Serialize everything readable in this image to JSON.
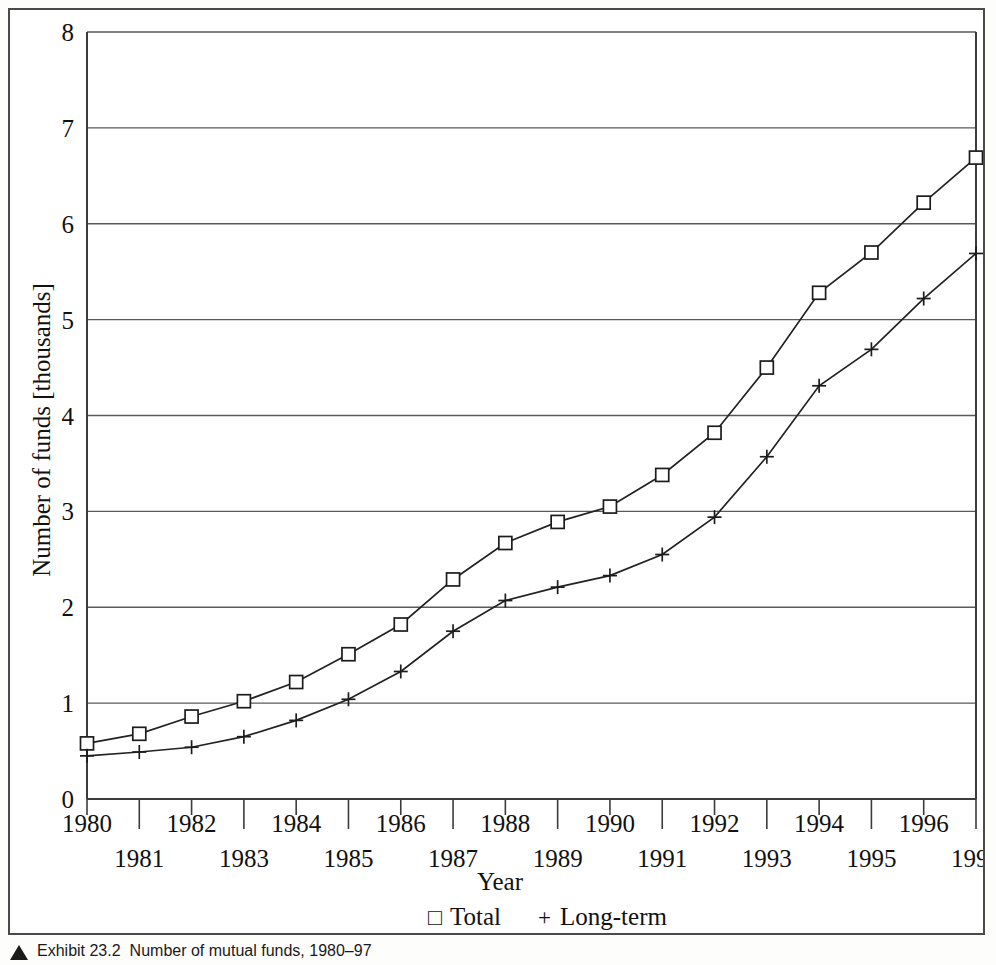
{
  "figure": {
    "caption_marker": "caption-triangle-icon",
    "caption_number": "Exhibit 23.2",
    "caption_text": "Number of mutual funds, 1980–97"
  },
  "chart_data": {
    "type": "line",
    "title": "",
    "xlabel": "Year",
    "ylabel": "Number of funds [thousands]",
    "xlim": [
      1980,
      1997
    ],
    "ylim": [
      0,
      8
    ],
    "ytick_step": 1,
    "yticks": [
      "0",
      "1",
      "2",
      "3",
      "4",
      "5",
      "6",
      "7",
      "8"
    ],
    "grid": "horizontal",
    "legend_position": "bottom-center",
    "x": [
      1980,
      1981,
      1982,
      1983,
      1984,
      1985,
      1986,
      1987,
      1988,
      1989,
      1990,
      1991,
      1992,
      1993,
      1994,
      1995,
      1996,
      1997
    ],
    "xtick_labels": [
      "1980",
      "1981",
      "1982",
      "1983",
      "1984",
      "1985",
      "1986",
      "1987",
      "1988",
      "1989",
      "1990",
      "1991",
      "1992",
      "1993",
      "1994",
      "1995",
      "1996",
      "1997"
    ],
    "series": [
      {
        "name": "Total",
        "marker": "square",
        "legend_glyph": "□",
        "values": [
          0.58,
          0.68,
          0.86,
          1.02,
          1.22,
          1.51,
          1.82,
          2.29,
          2.67,
          2.89,
          3.05,
          3.38,
          3.82,
          4.5,
          5.28,
          5.7,
          6.22,
          6.69
        ]
      },
      {
        "name": "Long-term",
        "marker": "plus",
        "legend_glyph": "+",
        "values": [
          0.45,
          0.49,
          0.54,
          0.65,
          0.82,
          1.04,
          1.33,
          1.75,
          2.07,
          2.21,
          2.33,
          2.55,
          2.94,
          3.57,
          4.31,
          4.69,
          5.22,
          5.69
        ]
      }
    ]
  }
}
